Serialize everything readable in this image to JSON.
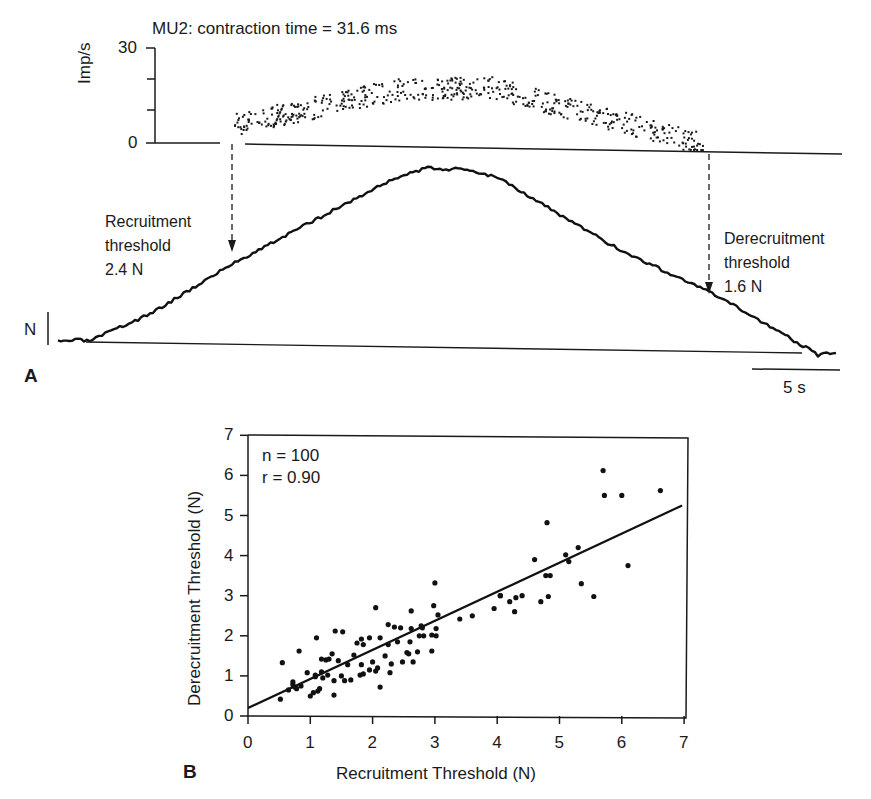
{
  "figure": {
    "panel_a_label": "A",
    "panel_b_label": "B"
  },
  "panel_a": {
    "title": "MU2: contraction time = 31.6 ms",
    "rate_axis": {
      "label": "Imp/s",
      "ticks": [
        "30",
        "0"
      ]
    },
    "force_scale_label": "N",
    "time_scale_label": "5 s",
    "recruitment": {
      "line1": "Recruitment",
      "line2": "threshold",
      "value": "2.4 N"
    },
    "derecruitment": {
      "line1": "Derecruitment",
      "line2": "threshold",
      "value": "1.6 N"
    }
  },
  "panel_b": {
    "xlabel": "Recruitment Threshold (N)",
    "ylabel": "Derecruitment Threshold (N)",
    "xticks": [
      "0",
      "1",
      "2",
      "3",
      "4",
      "5",
      "6",
      "7"
    ],
    "yticks": [
      "0",
      "1",
      "2",
      "3",
      "4",
      "5",
      "6",
      "7"
    ],
    "stat_n": "n = 100",
    "stat_r": "r = 0.90"
  },
  "chart_data": [
    {
      "type": "scatter",
      "title": "MU2: contraction time = 31.6 ms",
      "description": "Instantaneous discharge rate (Imp/s) of motor unit during a triangular isometric force ramp; force trace shown below with recruitment (2.4 N) and derecruitment (1.6 N) thresholds",
      "ylabel": "Imp/s",
      "ylim": [
        0,
        30
      ],
      "yticks": [
        0,
        30
      ],
      "xlabel": "Time (scale bar 5 s)",
      "series": [
        {
          "name": "discharge rate (approx. envelope)",
          "x_s": [
            0,
            5,
            10,
            14,
            18,
            22,
            25.5
          ],
          "y_imps": [
            6,
            13,
            17,
            19,
            15,
            10,
            3
          ]
        },
        {
          "name": "force trace (relative)",
          "shape": "triangular ramp, peak near mid-record"
        }
      ],
      "annotations": [
        "Recruitment threshold 2.4 N",
        "Derecruitment threshold 1.6 N",
        "N",
        "5 s"
      ],
      "grid": false
    },
    {
      "type": "scatter",
      "title": "",
      "xlabel": "Recruitment Threshold (N)",
      "ylabel": "Derecruitment Threshold (N)",
      "xlim": [
        0,
        7
      ],
      "ylim": [
        0,
        7
      ],
      "xticks": [
        0,
        1,
        2,
        3,
        4,
        5,
        6,
        7
      ],
      "yticks": [
        0,
        1,
        2,
        3,
        4,
        5,
        6,
        7
      ],
      "annotations": [
        "n = 100",
        "r = 0.90"
      ],
      "regression_line": {
        "x": [
          0,
          7
        ],
        "y": [
          0.2,
          5.25
        ]
      },
      "grid": false,
      "points": [
        [
          0.52,
          0.42
        ],
        [
          0.55,
          1.33
        ],
        [
          0.65,
          0.65
        ],
        [
          0.72,
          0.85
        ],
        [
          0.75,
          0.72
        ],
        [
          0.78,
          0.68
        ],
        [
          0.82,
          1.62
        ],
        [
          0.85,
          0.75
        ],
        [
          0.95,
          1.08
        ],
        [
          1.0,
          0.5
        ],
        [
          1.05,
          0.58
        ],
        [
          1.08,
          0.98
        ],
        [
          1.1,
          1.95
        ],
        [
          1.12,
          0.62
        ],
        [
          1.15,
          0.68
        ],
        [
          1.18,
          1.1
        ],
        [
          1.18,
          1.42
        ],
        [
          1.2,
          0.95
        ],
        [
          1.25,
          1.4
        ],
        [
          1.3,
          1.42
        ],
        [
          1.35,
          1.55
        ],
        [
          1.38,
          0.88
        ],
        [
          1.38,
          0.52
        ],
        [
          1.4,
          2.12
        ],
        [
          1.45,
          1.38
        ],
        [
          1.5,
          1.0
        ],
        [
          1.52,
          2.1
        ],
        [
          1.55,
          0.88
        ],
        [
          1.6,
          1.28
        ],
        [
          1.65,
          0.9
        ],
        [
          1.7,
          1.52
        ],
        [
          1.75,
          1.82
        ],
        [
          1.8,
          1.02
        ],
        [
          1.82,
          1.28
        ],
        [
          1.82,
          1.92
        ],
        [
          1.85,
          1.78
        ],
        [
          1.85,
          1.05
        ],
        [
          1.95,
          1.95
        ],
        [
          2.0,
          1.35
        ],
        [
          2.05,
          1.12
        ],
        [
          2.05,
          2.7
        ],
        [
          2.08,
          1.2
        ],
        [
          2.12,
          1.95
        ],
        [
          2.12,
          0.72
        ],
        [
          2.2,
          1.5
        ],
        [
          2.25,
          2.28
        ],
        [
          2.25,
          1.78
        ],
        [
          2.28,
          1.08
        ],
        [
          2.3,
          1.3
        ],
        [
          2.35,
          2.22
        ],
        [
          2.4,
          1.85
        ],
        [
          2.48,
          1.35
        ],
        [
          2.55,
          1.58
        ],
        [
          2.58,
          1.55
        ],
        [
          2.6,
          1.85
        ],
        [
          2.62,
          2.62
        ],
        [
          2.62,
          2.18
        ],
        [
          2.65,
          1.35
        ],
        [
          2.72,
          1.6
        ],
        [
          2.75,
          2.0
        ],
        [
          2.78,
          2.25
        ],
        [
          2.8,
          2.2
        ],
        [
          2.82,
          2.0
        ],
        [
          2.95,
          1.62
        ],
        [
          2.98,
          2.75
        ],
        [
          3.0,
          3.32
        ],
        [
          3.02,
          2.18
        ],
        [
          3.02,
          2.0
        ],
        [
          3.05,
          2.52
        ],
        [
          3.4,
          2.42
        ],
        [
          3.95,
          2.68
        ],
        [
          4.05,
          3.0
        ],
        [
          4.05,
          3.0
        ],
        [
          4.2,
          2.85
        ],
        [
          4.28,
          2.6
        ],
        [
          4.3,
          2.95
        ],
        [
          4.4,
          3.0
        ],
        [
          4.6,
          3.9
        ],
        [
          4.7,
          2.85
        ],
        [
          4.78,
          3.5
        ],
        [
          4.8,
          4.82
        ],
        [
          4.82,
          2.98
        ],
        [
          4.85,
          3.5
        ],
        [
          5.1,
          4.02
        ],
        [
          5.15,
          3.85
        ],
        [
          5.3,
          4.2
        ],
        [
          5.35,
          3.3
        ],
        [
          5.55,
          2.98
        ],
        [
          5.7,
          6.12
        ],
        [
          5.72,
          5.5
        ],
        [
          6.0,
          5.5
        ],
        [
          6.1,
          3.75
        ],
        [
          6.62,
          5.62
        ],
        [
          2.95,
          2.02
        ],
        [
          1.95,
          1.15
        ],
        [
          1.08,
          1.02
        ],
        [
          2.45,
          2.2
        ],
        [
          1.28,
          1.02
        ],
        [
          0.72,
          0.78
        ],
        [
          3.6,
          2.5
        ]
      ]
    }
  ]
}
